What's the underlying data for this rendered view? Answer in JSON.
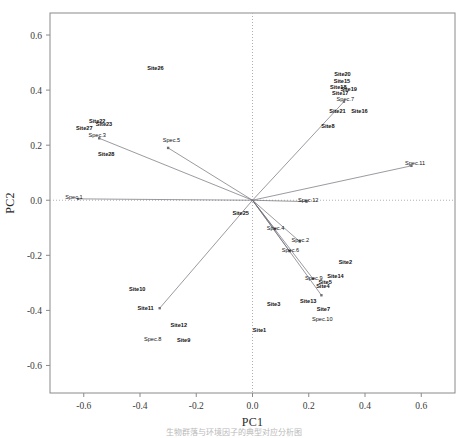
{
  "figure": {
    "caption_fragment": "生物群落与环境因子的典型对应分析图"
  },
  "chart_data": {
    "type": "scatter",
    "title": "",
    "subtitle": "",
    "xlabel": "PC1",
    "ylabel": "PC2",
    "xlim": [
      -0.72,
      0.72
    ],
    "ylim": [
      -0.7,
      0.68
    ],
    "xticks": [
      "-0.6",
      "-0.4",
      "-0.2",
      "0.0",
      "0.2",
      "0.4",
      "0.6"
    ],
    "xtick_values": [
      -0.6,
      -0.4,
      -0.2,
      0.0,
      0.2,
      0.4,
      0.6
    ],
    "yticks": [
      "0.6",
      "0.4",
      "0.2",
      "0.0",
      "-0.2",
      "-0.4",
      "-0.6"
    ],
    "ytick_values": [
      0.6,
      0.4,
      0.2,
      0.0,
      -0.2,
      -0.4,
      -0.6
    ],
    "grid": false,
    "reference_lines": {
      "vertical_at_x": 0.0,
      "horizontal_at_y": 0.0,
      "style": "dotted"
    },
    "legend": "none",
    "colors": {
      "site_label": "#101010",
      "species_label": "#101010",
      "vector_line": "#6f6f78",
      "axis": "#8a8a8a",
      "reference_line": "#b0b0b0"
    },
    "series": [
      {
        "name": "Sites",
        "marker": "text-label",
        "points": [
          {
            "label": "Site1",
            "x": 0.025,
            "y": -0.478
          },
          {
            "label": "Site2",
            "x": 0.33,
            "y": -0.232
          },
          {
            "label": "Site3",
            "x": 0.075,
            "y": -0.384
          },
          {
            "label": "Site4",
            "x": 0.25,
            "y": -0.32
          },
          {
            "label": "Site5",
            "x": 0.258,
            "y": -0.303
          },
          {
            "label": "Site7",
            "x": 0.252,
            "y": -0.402
          },
          {
            "label": "Site9",
            "x": -0.245,
            "y": -0.515
          },
          {
            "label": "Site10",
            "x": -0.41,
            "y": -0.33
          },
          {
            "label": "Site11",
            "x": -0.38,
            "y": -0.398
          },
          {
            "label": "Site12",
            "x": -0.262,
            "y": -0.462
          },
          {
            "label": "Site13",
            "x": 0.198,
            "y": -0.372
          },
          {
            "label": "Site14",
            "x": 0.295,
            "y": -0.283
          },
          {
            "label": "Site15",
            "x": 0.318,
            "y": 0.425
          },
          {
            "label": "Site16",
            "x": 0.38,
            "y": 0.318
          },
          {
            "label": "Site17",
            "x": 0.312,
            "y": 0.382
          },
          {
            "label": "Site18",
            "x": 0.305,
            "y": 0.405
          },
          {
            "label": "Site19",
            "x": 0.342,
            "y": 0.398
          },
          {
            "label": "Site20",
            "x": 0.32,
            "y": 0.452
          },
          {
            "label": "Site21",
            "x": 0.302,
            "y": 0.318
          },
          {
            "label": "Site22",
            "x": -0.552,
            "y": 0.282
          },
          {
            "label": "Site23",
            "x": -0.528,
            "y": 0.268
          },
          {
            "label": "Site25",
            "x": -0.042,
            "y": -0.055
          },
          {
            "label": "Site26",
            "x": -0.345,
            "y": 0.472
          },
          {
            "label": "Site27",
            "x": -0.598,
            "y": 0.255
          },
          {
            "label": "Site28",
            "x": -0.52,
            "y": 0.16
          },
          {
            "label": "Site8",
            "x": 0.268,
            "y": 0.262
          }
        ]
      },
      {
        "name": "Species vectors",
        "marker": "arrow-endpoint",
        "points": [
          {
            "label": "Spec.1",
            "x": -0.635,
            "y": 0.005
          },
          {
            "label": "Spec.2",
            "x": 0.17,
            "y": -0.152
          },
          {
            "label": "Spec.3",
            "x": -0.552,
            "y": 0.228
          },
          {
            "label": "Spec.4",
            "x": 0.082,
            "y": -0.108
          },
          {
            "label": "Spec.5",
            "x": -0.288,
            "y": 0.212
          },
          {
            "label": "Spec.6",
            "x": 0.135,
            "y": -0.188
          },
          {
            "label": "Spec.7",
            "x": 0.33,
            "y": 0.362
          },
          {
            "label": "Spec.8",
            "x": -0.355,
            "y": -0.512
          },
          {
            "label": "Spec.9",
            "x": 0.218,
            "y": -0.29
          },
          {
            "label": "Spec.10",
            "x": 0.248,
            "y": -0.44
          },
          {
            "label": "Spec.11",
            "x": 0.578,
            "y": 0.128
          },
          {
            "label": "Spec.12",
            "x": 0.198,
            "y": -0.005
          }
        ]
      }
    ],
    "vectors": [
      {
        "label": "Spec.1",
        "x": -0.62,
        "y": 0.005
      },
      {
        "label": "Spec.2",
        "x": 0.168,
        "y": -0.15
      },
      {
        "label": "Spec.3",
        "x": -0.545,
        "y": 0.225
      },
      {
        "label": "Spec.4",
        "x": 0.08,
        "y": -0.105
      },
      {
        "label": "Spec.5",
        "x": -0.3,
        "y": 0.19
      },
      {
        "label": "Spec.6",
        "x": 0.132,
        "y": -0.185
      },
      {
        "label": "Spec.7",
        "x": 0.325,
        "y": 0.358
      },
      {
        "label": "Spec.8",
        "x": -0.33,
        "y": -0.392
      },
      {
        "label": "Spec.9",
        "x": 0.215,
        "y": -0.285
      },
      {
        "label": "Spec.10",
        "x": 0.245,
        "y": -0.345
      },
      {
        "label": "Spec.11",
        "x": 0.565,
        "y": 0.125
      },
      {
        "label": "Spec.12",
        "x": 0.192,
        "y": -0.005
      }
    ]
  }
}
